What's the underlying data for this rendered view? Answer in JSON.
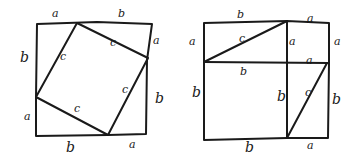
{
  "diagram": {
    "left_figure": {
      "outer_square": {
        "x1": 36,
        "y1": 23,
        "x2": 147,
        "y2": 135
      },
      "inner_square": [
        [
          76,
          23
        ],
        [
          147,
          58
        ],
        [
          108,
          135
        ],
        [
          36,
          97
        ]
      ],
      "labels": [
        {
          "text": "a",
          "x": 52,
          "y": 17
        },
        {
          "text": "b",
          "x": 118,
          "y": 17
        },
        {
          "text": "b",
          "x": 20,
          "y": 62,
          "big": true
        },
        {
          "text": "a",
          "x": 153,
          "y": 44
        },
        {
          "text": "b",
          "x": 155,
          "y": 103,
          "big": true
        },
        {
          "text": "a",
          "x": 24,
          "y": 120
        },
        {
          "text": "b",
          "x": 66,
          "y": 152,
          "big": true
        },
        {
          "text": "a",
          "x": 129,
          "y": 148
        },
        {
          "text": "c",
          "x": 60,
          "y": 60
        },
        {
          "text": "c",
          "x": 110,
          "y": 46
        },
        {
          "text": "c",
          "x": 122,
          "y": 93
        },
        {
          "text": "c",
          "x": 74,
          "y": 112
        }
      ]
    },
    "right_figure": {
      "outer_square": {
        "x1": 204,
        "y1": 23,
        "x2": 329,
        "y2": 138
      },
      "divider_vertical_x": 287,
      "divider_horizontal_y": 62,
      "diagonals": [
        [
          [
            204,
            62
          ],
          [
            287,
            21
          ]
        ],
        [
          [
            287,
            138
          ],
          [
            327,
            63
          ]
        ]
      ],
      "labels": [
        {
          "text": "b",
          "x": 237,
          "y": 18
        },
        {
          "text": "a",
          "x": 307,
          "y": 22
        },
        {
          "text": "a",
          "x": 189,
          "y": 45
        },
        {
          "text": "c",
          "x": 239,
          "y": 42
        },
        {
          "text": "a",
          "x": 289,
          "y": 45
        },
        {
          "text": "a",
          "x": 334,
          "y": 45
        },
        {
          "text": "a",
          "x": 306,
          "y": 64
        },
        {
          "text": "b",
          "x": 240,
          "y": 75
        },
        {
          "text": "b",
          "x": 192,
          "y": 97,
          "big": true
        },
        {
          "text": "b",
          "x": 277,
          "y": 101,
          "big": true
        },
        {
          "text": "c",
          "x": 305,
          "y": 96
        },
        {
          "text": "b",
          "x": 332,
          "y": 104,
          "big": true
        },
        {
          "text": "b",
          "x": 245,
          "y": 152,
          "big": true
        },
        {
          "text": "a",
          "x": 307,
          "y": 149
        }
      ]
    }
  }
}
